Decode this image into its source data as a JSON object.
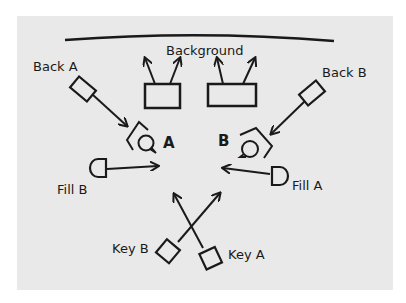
{
  "diagram": {
    "background_label": "Background",
    "subjects": [
      {
        "id": "A",
        "label": "A"
      },
      {
        "id": "B",
        "label": "B"
      }
    ],
    "lights": [
      {
        "id": "back-a",
        "label": "Back A"
      },
      {
        "id": "back-b",
        "label": "Back B"
      },
      {
        "id": "fill-a",
        "label": "Fill A"
      },
      {
        "id": "fill-b",
        "label": "Fill B"
      },
      {
        "id": "key-a",
        "label": "Key A"
      },
      {
        "id": "key-b",
        "label": "Key B"
      }
    ],
    "colors": {
      "paper": "#e9e9e9",
      "ink": "#1a1a1a"
    }
  }
}
